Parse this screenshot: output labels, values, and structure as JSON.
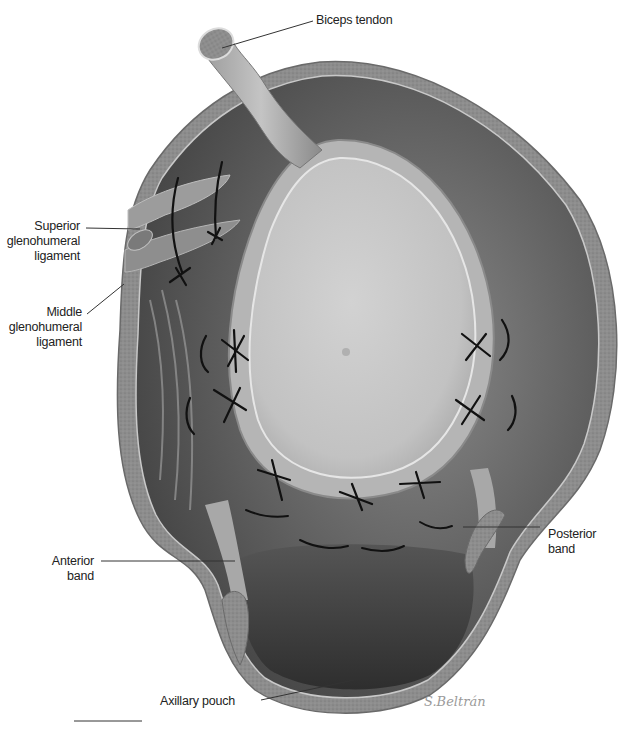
{
  "figure": {
    "labels": {
      "biceps_tendon": "Biceps tendon",
      "superior_gh_ligament": [
        "Superior",
        "glenohumeral",
        "ligament"
      ],
      "middle_gh_ligament": [
        "Middle",
        "glenohumeral",
        "ligament"
      ],
      "anterior_band": [
        "Anterior",
        "band"
      ],
      "posterior_band": [
        "Posterior",
        "band"
      ],
      "axillary_pouch": "Axillary pouch"
    },
    "signature": "S.Beltrán",
    "colors": {
      "capsule_dark": "#4a4a4a",
      "capsule_mid": "#7a7a7a",
      "glenoid_light": "#c8c8c8",
      "tissue_edge": "#8e8e8e",
      "suture": "#111111",
      "leader_line": "#333333"
    }
  }
}
